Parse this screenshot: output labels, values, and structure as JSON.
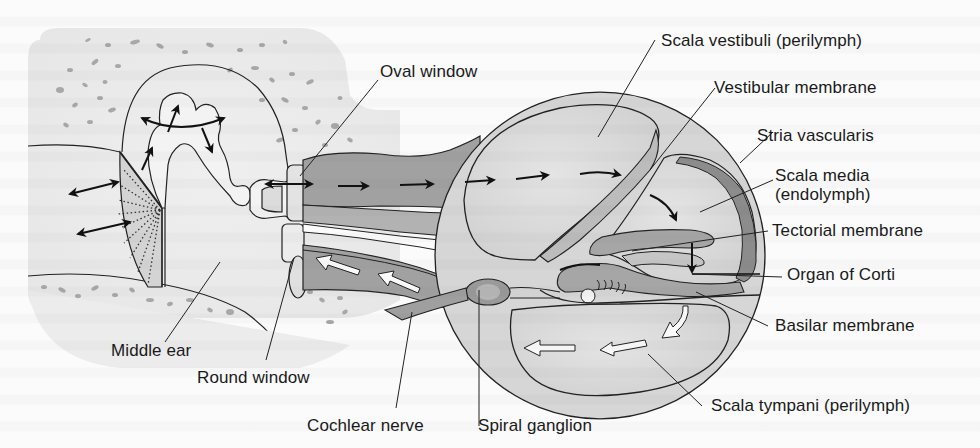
{
  "figure": {
    "type": "anatomical-diagram",
    "colors": {
      "background": "#fbfbfb",
      "bone_fill": "#ececec",
      "bone_speckle": "#a9a9a9",
      "fluid_dark": "#9d9d9d",
      "fluid_mid": "#bdbdbd",
      "fluid_light": "#d9d9d9",
      "membrane_dark": "#8a8a8a",
      "outline": "#222222",
      "text": "#1a1a1a"
    }
  },
  "labels": {
    "oval_window": "Oval window",
    "scala_vestibuli": "Scala vestibuli (perilymph)",
    "vestibular_membrane": "Vestibular membrane",
    "stria_vascularis": "Stria vascularis",
    "scala_media_line1": "Scala media",
    "scala_media_line2": "(endolymph)",
    "tectorial_membrane": "Tectorial membrane",
    "organ_of_corti": "Organ of Corti",
    "basilar_membrane": "Basilar membrane",
    "scala_tympani": "Scala tympani (perilymph)",
    "spiral_ganglion": "Spiral ganglion",
    "cochlear_nerve": "Cochlear nerve",
    "round_window": "Round window",
    "middle_ear": "Middle ear"
  },
  "arrows": {
    "forward_path": "black arrows: oval window → scala vestibuli → scala media",
    "return_path": "white arrows: scala tympani → round window"
  }
}
